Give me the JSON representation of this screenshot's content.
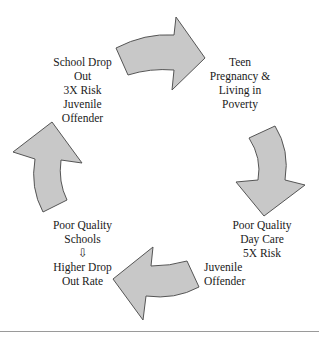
{
  "diagram": {
    "type": "cycle",
    "colors": {
      "arrow_fill": "#c8c8c8",
      "arrow_stroke": "#555555",
      "text": "#1a1a1a",
      "rule": "#9a9a9a"
    },
    "nodes": [
      {
        "id": "teen-pregnancy",
        "lines": [
          "Teen",
          "Pregnancy &",
          "Living in",
          "Poverty"
        ]
      },
      {
        "id": "poor-day-care",
        "lines": [
          "Poor Quality",
          "Day Care",
          "5X Risk",
          "Juvenile",
          "Offender"
        ]
      },
      {
        "id": "poor-schools",
        "lines": [
          "Poor Quality",
          "Schools",
          "⇩",
          "Higher Drop",
          "Out Rate"
        ]
      },
      {
        "id": "school-drop-out",
        "lines": [
          "School Drop",
          "Out",
          "3X Risk",
          "Juvenile",
          "Offender"
        ]
      }
    ],
    "arrows": [
      {
        "id": "arrow-top",
        "from": "school-drop-out",
        "to": "teen-pregnancy",
        "direction": "right"
      },
      {
        "id": "arrow-right",
        "from": "teen-pregnancy",
        "to": "poor-day-care",
        "direction": "down"
      },
      {
        "id": "arrow-bottom",
        "from": "poor-day-care",
        "to": "poor-schools",
        "direction": "left"
      },
      {
        "id": "arrow-left",
        "from": "poor-schools",
        "to": "school-drop-out",
        "direction": "up"
      }
    ]
  }
}
